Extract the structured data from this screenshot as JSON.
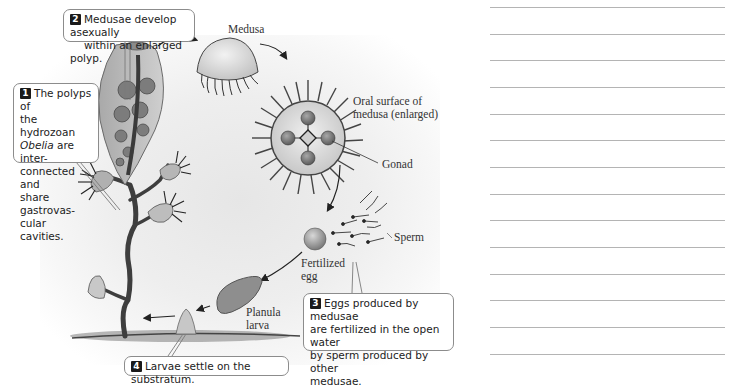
{
  "figure": {
    "callouts": [
      {
        "number": "1",
        "text_before": "The polyps of the hydrozoan ",
        "italic": "Obelia",
        "text_after": " are inter-connected and share gastrovas-cular cavities.",
        "lines": [
          "The polyps of",
          "the hydrozoan",
          "Obelia",
          " are inter-",
          "connected and",
          "share gastrovas-",
          "cular cavities."
        ]
      },
      {
        "number": "2",
        "lines": [
          "Medusae develop asexually",
          "within an enlarged polyp."
        ]
      },
      {
        "number": "3",
        "lines": [
          "Eggs produced by medusae",
          "are fertilized in the open water",
          "by sperm produced by other",
          "medusae."
        ]
      },
      {
        "number": "4",
        "lines": [
          "Larvae settle on the  substratum."
        ]
      }
    ],
    "labels": {
      "medusa": "Medusa",
      "oral_surface": [
        "Oral surface of",
        "medusa (enlarged)"
      ],
      "gonad": "Gonad",
      "sperm": "Sperm",
      "fertilized_egg": [
        "Fertilized",
        "egg"
      ],
      "planula_larva": [
        "Planula",
        "larva"
      ]
    },
    "colors": {
      "callout_border": "#8c8c8c",
      "number_badge": "#1a1a1a",
      "polyp_fill": "#b9b9b9",
      "stalk": "#4a4a4a",
      "gonad": "#6d6d6d",
      "rule": "#b4b4b4"
    }
  },
  "notes_panel": {
    "line_count": 14,
    "line_positions_y": [
      7,
      34,
      60,
      87,
      114,
      140,
      167,
      194,
      220,
      247,
      274,
      300,
      327,
      354
    ]
  }
}
